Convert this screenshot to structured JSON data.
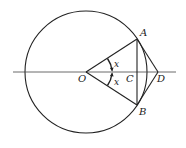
{
  "diagram": {
    "type": "geometry",
    "colors": {
      "stroke": "#222222",
      "background": "#ffffff"
    },
    "circle": {
      "cx": 86,
      "cy": 72,
      "r": 61
    },
    "axis_line": {
      "x1": 13,
      "y1": 72,
      "x2": 176,
      "y2": 72
    },
    "points": {
      "O": {
        "label": "O",
        "x": 86,
        "y": 72
      },
      "A": {
        "label": "A",
        "x": 137,
        "y": 39
      },
      "B": {
        "label": "B",
        "x": 137,
        "y": 105
      },
      "C": {
        "label": "C",
        "x": 137,
        "y": 72
      },
      "D": {
        "label": "D",
        "x": 158,
        "y": 72
      }
    },
    "angle_labels": {
      "upper": "x",
      "lower": "x"
    }
  }
}
